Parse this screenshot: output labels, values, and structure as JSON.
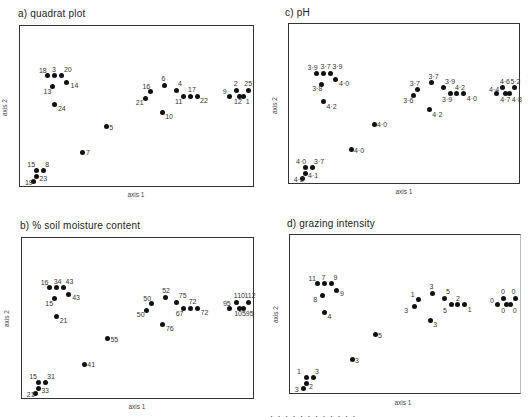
{
  "figure": {
    "axis_x_label": "axis 1",
    "axis_y_label": "axis 2",
    "caption_fragment": "· · · · · · · · · · · ·"
  },
  "chart_data": [
    {
      "type": "scatter",
      "title": "a) quadrat plot",
      "xlabel": "axis 1",
      "ylabel": "axis 2",
      "grid": false,
      "points": [
        {
          "x": 0.12,
          "y": 0.31,
          "label": "18"
        },
        {
          "x": 0.15,
          "y": 0.31,
          "label": "3"
        },
        {
          "x": 0.18,
          "y": 0.31,
          "label": "20"
        },
        {
          "x": 0.2,
          "y": 0.35,
          "label": "14"
        },
        {
          "x": 0.14,
          "y": 0.38,
          "label": "13"
        },
        {
          "x": 0.15,
          "y": 0.49,
          "label": "24"
        },
        {
          "x": 0.37,
          "y": 0.63,
          "label": "5"
        },
        {
          "x": 0.27,
          "y": 0.79,
          "label": "7"
        },
        {
          "x": 0.07,
          "y": 0.9,
          "label": "15"
        },
        {
          "x": 0.1,
          "y": 0.9,
          "label": "8"
        },
        {
          "x": 0.07,
          "y": 0.94,
          "label": "23"
        },
        {
          "x": 0.06,
          "y": 0.97,
          "label": "19"
        },
        {
          "x": 0.56,
          "y": 0.41,
          "label": "16"
        },
        {
          "x": 0.54,
          "y": 0.45,
          "label": "21"
        },
        {
          "x": 0.62,
          "y": 0.37,
          "label": "6"
        },
        {
          "x": 0.67,
          "y": 0.4,
          "label": "4"
        },
        {
          "x": 0.7,
          "y": 0.44,
          "label": "11"
        },
        {
          "x": 0.73,
          "y": 0.44,
          "label": "17"
        },
        {
          "x": 0.76,
          "y": 0.44,
          "label": "22"
        },
        {
          "x": 0.61,
          "y": 0.54,
          "label": "10"
        },
        {
          "x": 0.9,
          "y": 0.44,
          "label": "9"
        },
        {
          "x": 0.93,
          "y": 0.4,
          "label": "2"
        },
        {
          "x": 0.94,
          "y": 0.44,
          "label": "12"
        },
        {
          "x": 0.96,
          "y": 0.44,
          "label": "1"
        },
        {
          "x": 0.98,
          "y": 0.4,
          "label": "25"
        }
      ]
    },
    {
      "type": "scatter",
      "title": "c) pH",
      "xlabel": "axis 1",
      "ylabel": "axis 2",
      "grid": false,
      "points": [
        {
          "x": 0.12,
          "y": 0.31,
          "label": "3·9"
        },
        {
          "x": 0.15,
          "y": 0.31,
          "label": "3·7"
        },
        {
          "x": 0.18,
          "y": 0.31,
          "label": "3·9"
        },
        {
          "x": 0.2,
          "y": 0.35,
          "label": "4·0"
        },
        {
          "x": 0.14,
          "y": 0.38,
          "label": "3·8"
        },
        {
          "x": 0.15,
          "y": 0.49,
          "label": "4·2"
        },
        {
          "x": 0.37,
          "y": 0.63,
          "label": "4·0"
        },
        {
          "x": 0.27,
          "y": 0.79,
          "label": "4·0"
        },
        {
          "x": 0.07,
          "y": 0.9,
          "label": "4·0"
        },
        {
          "x": 0.1,
          "y": 0.9,
          "label": "3·7"
        },
        {
          "x": 0.07,
          "y": 0.94,
          "label": "4·1"
        },
        {
          "x": 0.06,
          "y": 0.97,
          "label": "4·2"
        },
        {
          "x": 0.56,
          "y": 0.41,
          "label": "3·7"
        },
        {
          "x": 0.54,
          "y": 0.45,
          "label": "3·6"
        },
        {
          "x": 0.62,
          "y": 0.37,
          "label": "3·7"
        },
        {
          "x": 0.67,
          "y": 0.4,
          "label": "3·9"
        },
        {
          "x": 0.7,
          "y": 0.44,
          "label": "3·9"
        },
        {
          "x": 0.73,
          "y": 0.44,
          "label": "4·2"
        },
        {
          "x": 0.76,
          "y": 0.44,
          "label": "4·0"
        },
        {
          "x": 0.61,
          "y": 0.54,
          "label": "4·2"
        },
        {
          "x": 0.9,
          "y": 0.44,
          "label": "4·4"
        },
        {
          "x": 0.93,
          "y": 0.4,
          "label": "4·6"
        },
        {
          "x": 0.94,
          "y": 0.44,
          "label": "4·7"
        },
        {
          "x": 0.96,
          "y": 0.44,
          "label": "4·8"
        },
        {
          "x": 0.98,
          "y": 0.4,
          "label": "5·2"
        }
      ]
    },
    {
      "type": "scatter",
      "title": "b) % soil moisture content",
      "xlabel": "axis 1",
      "ylabel": "axis 2",
      "grid": false,
      "points": [
        {
          "x": 0.12,
          "y": 0.31,
          "label": "16"
        },
        {
          "x": 0.15,
          "y": 0.31,
          "label": "34"
        },
        {
          "x": 0.18,
          "y": 0.31,
          "label": "43"
        },
        {
          "x": 0.2,
          "y": 0.35,
          "label": "43"
        },
        {
          "x": 0.14,
          "y": 0.38,
          "label": "15"
        },
        {
          "x": 0.15,
          "y": 0.49,
          "label": "21"
        },
        {
          "x": 0.37,
          "y": 0.63,
          "label": "55"
        },
        {
          "x": 0.27,
          "y": 0.79,
          "label": "41"
        },
        {
          "x": 0.07,
          "y": 0.9,
          "label": "15"
        },
        {
          "x": 0.1,
          "y": 0.9,
          "label": "31"
        },
        {
          "x": 0.07,
          "y": 0.94,
          "label": "33"
        },
        {
          "x": 0.06,
          "y": 0.97,
          "label": "21"
        },
        {
          "x": 0.56,
          "y": 0.41,
          "label": "50"
        },
        {
          "x": 0.54,
          "y": 0.45,
          "label": "50"
        },
        {
          "x": 0.62,
          "y": 0.37,
          "label": "52"
        },
        {
          "x": 0.67,
          "y": 0.4,
          "label": "75"
        },
        {
          "x": 0.7,
          "y": 0.44,
          "label": "67"
        },
        {
          "x": 0.73,
          "y": 0.44,
          "label": "72"
        },
        {
          "x": 0.76,
          "y": 0.44,
          "label": "72"
        },
        {
          "x": 0.61,
          "y": 0.54,
          "label": "76"
        },
        {
          "x": 0.9,
          "y": 0.44,
          "label": "95"
        },
        {
          "x": 0.93,
          "y": 0.4,
          "label": "110"
        },
        {
          "x": 0.94,
          "y": 0.44,
          "label": "105"
        },
        {
          "x": 0.96,
          "y": 0.44,
          "label": "95"
        },
        {
          "x": 0.98,
          "y": 0.4,
          "label": "112"
        }
      ]
    },
    {
      "type": "scatter",
      "title": "d) grazing intensity",
      "xlabel": "axis 1",
      "ylabel": "axis 2",
      "grid": false,
      "points": [
        {
          "x": 0.12,
          "y": 0.31,
          "label": "11"
        },
        {
          "x": 0.15,
          "y": 0.31,
          "label": "7"
        },
        {
          "x": 0.18,
          "y": 0.31,
          "label": "9"
        },
        {
          "x": 0.2,
          "y": 0.35,
          "label": "9"
        },
        {
          "x": 0.14,
          "y": 0.38,
          "label": "8"
        },
        {
          "x": 0.15,
          "y": 0.49,
          "label": "4"
        },
        {
          "x": 0.37,
          "y": 0.63,
          "label": "5"
        },
        {
          "x": 0.27,
          "y": 0.79,
          "label": "3"
        },
        {
          "x": 0.07,
          "y": 0.9,
          "label": "1"
        },
        {
          "x": 0.1,
          "y": 0.9,
          "label": "3"
        },
        {
          "x": 0.07,
          "y": 0.94,
          "label": "2"
        },
        {
          "x": 0.06,
          "y": 0.97,
          "label": "3"
        },
        {
          "x": 0.56,
          "y": 0.41,
          "label": "1"
        },
        {
          "x": 0.54,
          "y": 0.45,
          "label": "3"
        },
        {
          "x": 0.62,
          "y": 0.37,
          "label": "3"
        },
        {
          "x": 0.67,
          "y": 0.4,
          "label": "5"
        },
        {
          "x": 0.7,
          "y": 0.44,
          "label": "5"
        },
        {
          "x": 0.73,
          "y": 0.44,
          "label": "2"
        },
        {
          "x": 0.76,
          "y": 0.44,
          "label": "1"
        },
        {
          "x": 0.61,
          "y": 0.54,
          "label": "3"
        },
        {
          "x": 0.9,
          "y": 0.44,
          "label": "0"
        },
        {
          "x": 0.93,
          "y": 0.4,
          "label": "0"
        },
        {
          "x": 0.94,
          "y": 0.44,
          "label": "0"
        },
        {
          "x": 0.96,
          "y": 0.44,
          "label": "0"
        },
        {
          "x": 0.98,
          "y": 0.4,
          "label": "0"
        }
      ]
    }
  ]
}
